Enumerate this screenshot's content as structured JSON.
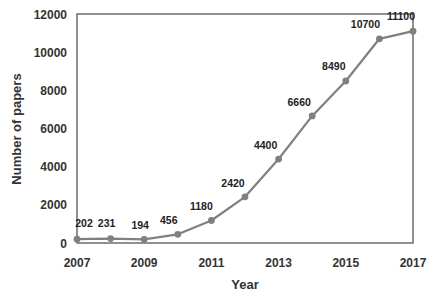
{
  "chart_data": {
    "type": "line",
    "title": "",
    "xlabel": "Year",
    "ylabel": "Number of papers",
    "x": [
      2007,
      2008,
      2009,
      2010,
      2011,
      2012,
      2013,
      2014,
      2015,
      2016,
      2017
    ],
    "series": [
      {
        "name": "Number of papers",
        "values": [
          202,
          231,
          194,
          456,
          1180,
          2420,
          4400,
          6660,
          8490,
          10700,
          11100
        ],
        "color": "#808080",
        "marker": "circle",
        "data_labels": true
      }
    ],
    "x_ticks": [
      "2007",
      "2009",
      "2011",
      "2013",
      "2015",
      "2017"
    ],
    "y_ticks": [
      "0",
      "2000",
      "4000",
      "6000",
      "8000",
      "10000",
      "12000"
    ],
    "xlim": [
      2007,
      2017
    ],
    "ylim": [
      0,
      12000
    ],
    "grid": false,
    "legend": "none"
  }
}
